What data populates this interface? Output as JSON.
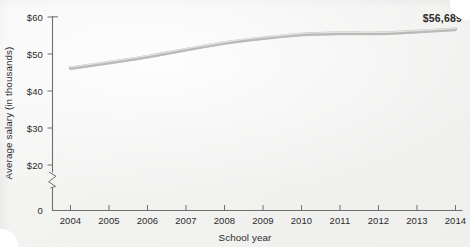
{
  "chart_data": {
    "type": "line",
    "title": "",
    "xlabel": "School year",
    "ylabel": "Average salary (in thousands)",
    "categories": [
      "2004",
      "2005",
      "2006",
      "2007",
      "2008",
      "2009",
      "2010",
      "2011",
      "2012",
      "2013",
      "2014"
    ],
    "x": [
      2004,
      2005,
      2006,
      2007,
      2008,
      2009,
      2010,
      2011,
      2012,
      2013,
      2014
    ],
    "values": [
      46.2,
      47.7,
      49.3,
      51.2,
      53.0,
      54.3,
      55.3,
      55.6,
      55.6,
      56.1,
      56.7
    ],
    "series": [
      {
        "name": "Average salary",
        "values": [
          46.2,
          47.7,
          49.3,
          51.2,
          53.0,
          54.3,
          55.3,
          55.6,
          55.6,
          56.1,
          56.7
        ]
      }
    ],
    "ytick_labels": [
      "$60",
      "$50",
      "$40",
      "$30",
      "$20",
      "0"
    ],
    "ytick_values": [
      60,
      50,
      40,
      30,
      20,
      0
    ],
    "ylim": [
      20,
      60
    ],
    "y_axis_break": true,
    "y_axis_break_between": [
      0,
      20
    ],
    "xlim": [
      2004,
      2014
    ],
    "grid": false,
    "legend": false,
    "legend_position": "none",
    "annotations": [
      {
        "name": "endpoint-value-label",
        "text": "$56,689",
        "x": 2014,
        "y": 56.689
      }
    ],
    "units": "thousands of US dollars",
    "line_color": "#b9b9b7",
    "axis_color": "#6f6f6f",
    "text_color": "#2b2b2b",
    "background_color": "#f2f2f1"
  },
  "axis": {
    "y_title": "Average salary (in thousands)",
    "x_title": "School year",
    "y_ticks": [
      {
        "label": "$60"
      },
      {
        "label": "$50"
      },
      {
        "label": "$40"
      },
      {
        "label": "$30"
      },
      {
        "label": "$20"
      },
      {
        "label": "0"
      }
    ],
    "x_ticks": [
      {
        "label": "2004"
      },
      {
        "label": "2005"
      },
      {
        "label": "2006"
      },
      {
        "label": "2007"
      },
      {
        "label": "2008"
      },
      {
        "label": "2009"
      },
      {
        "label": "2010"
      },
      {
        "label": "2011"
      },
      {
        "label": "2012"
      },
      {
        "label": "2013"
      },
      {
        "label": "2014"
      }
    ]
  },
  "callout": {
    "end_value": "$56,689"
  }
}
